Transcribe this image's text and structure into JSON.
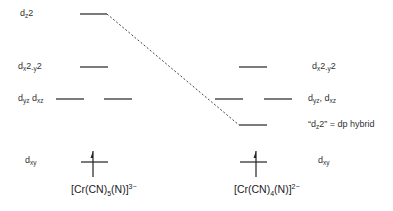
{
  "diagram": {
    "type": "d-orbital energy level diagram",
    "line_color": "#222222",
    "dash_color": "#444444"
  },
  "left_complex": {
    "formula_parts": {
      "pre": "[Cr(CN)",
      "sub": "5",
      "mid": "(N)]",
      "sup": "3−"
    },
    "levels": {
      "dz2": {
        "base": "d",
        "sub": "z",
        "tail": "2"
      },
      "dx2y2": {
        "base": "d",
        "sub": "x",
        "mid": "2",
        "sub2": "-y",
        "tail": "2"
      },
      "dyz_dxz": {
        "base1": "d",
        "sub1": "yz",
        "sep": " ",
        "base2": "d",
        "sub2": "xz"
      },
      "dxy": {
        "base": "d",
        "sub": "xy"
      }
    },
    "electrons_in_dxy": 1
  },
  "right_complex": {
    "formula_parts": {
      "pre": "[Cr(CN)",
      "sub": "4",
      "mid": "(N)]",
      "sup": "2−"
    },
    "levels": {
      "dx2y2": {
        "base": "d",
        "sub": "x",
        "mid": "2",
        "sub2": "-y",
        "tail": "2"
      },
      "dyz_dxz": {
        "base1": "d",
        "sub1": "yz",
        "sep": ", ",
        "base2": "d",
        "sub2": "xz"
      },
      "dz2_hybrid": {
        "pre": "“d",
        "sub": "z",
        "tail": "2” = dp hybrid"
      },
      "dxy": {
        "base": "d",
        "sub": "xy"
      }
    },
    "electrons_in_dxy": 1
  },
  "correlation": {
    "from": "dz2 (left)",
    "to": "dz2 dp hybrid (right)",
    "style": "dashed"
  }
}
